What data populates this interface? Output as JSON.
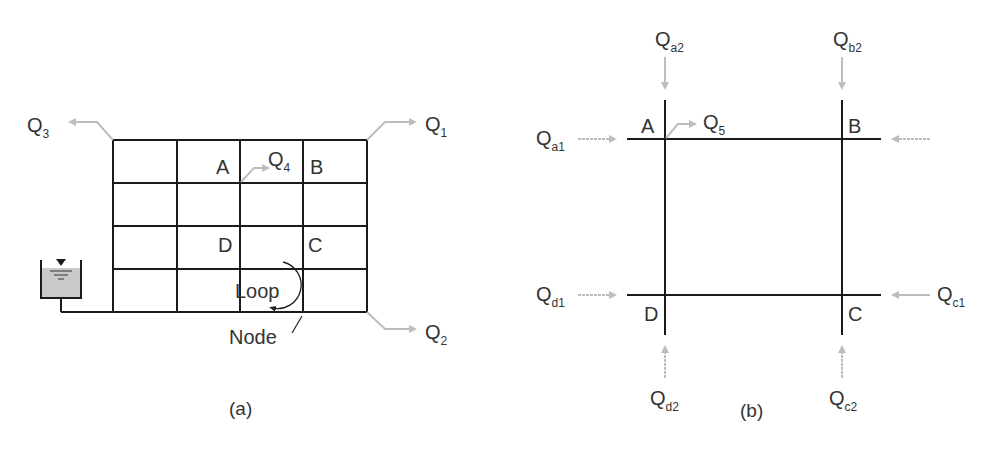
{
  "colors": {
    "pipe": "#1a1a1a",
    "arrow": "#bdbdbd",
    "tank_fill": "#c9c9c9",
    "text": "#333333"
  },
  "panel_a": {
    "caption": "(a)",
    "nodes": {
      "A": "A",
      "B": "B",
      "C": "C",
      "D": "D"
    },
    "flows": {
      "q1": {
        "main": "Q",
        "sub": "1"
      },
      "q2": {
        "main": "Q",
        "sub": "2"
      },
      "q3": {
        "main": "Q",
        "sub": "3"
      },
      "q4": {
        "main": "Q",
        "sub": "4"
      }
    },
    "loop_label": "Loop",
    "node_label": "Node",
    "grid": {
      "cols": 4,
      "rows": 4
    }
  },
  "panel_b": {
    "caption": "(b)",
    "nodes": {
      "A": "A",
      "B": "B",
      "C": "C",
      "D": "D"
    },
    "flows": {
      "qa1": {
        "main": "Q",
        "sub": "a1"
      },
      "qa2": {
        "main": "Q",
        "sub": "a2"
      },
      "qb2": {
        "main": "Q",
        "sub": "b2"
      },
      "q5": {
        "main": "Q",
        "sub": "5"
      },
      "qd1": {
        "main": "Q",
        "sub": "d1"
      },
      "qd2": {
        "main": "Q",
        "sub": "d2"
      },
      "qc1": {
        "main": "Q",
        "sub": "c1"
      },
      "qc2": {
        "main": "Q",
        "sub": "c2"
      }
    }
  }
}
